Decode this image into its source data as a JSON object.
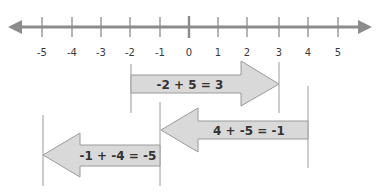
{
  "number_line": {
    "min": -5,
    "max": 5,
    "ticks": [
      "-5",
      "-4",
      "-3",
      "-2",
      "-1",
      "0",
      "1",
      "2",
      "3",
      "4",
      "5"
    ],
    "tick_x": [
      42,
      72,
      101,
      130,
      160,
      189,
      218,
      247,
      279,
      308,
      338
    ],
    "axis_color": "#8c8c8c"
  },
  "arrows": [
    {
      "equation": "-2 + 5 = 3",
      "from": -2,
      "to": 3,
      "direction": "right"
    },
    {
      "equation": "4 + -5 = -1",
      "from": 4,
      "to": -1,
      "direction": "left"
    },
    {
      "equation": "-1 + -4 = -5",
      "from": -1,
      "to": -5,
      "direction": "left"
    }
  ],
  "colors": {
    "arrow_fill": "#d9d9d9",
    "arrow_stroke": "#9a9a9a",
    "guide_line": "#9a9a9a"
  }
}
